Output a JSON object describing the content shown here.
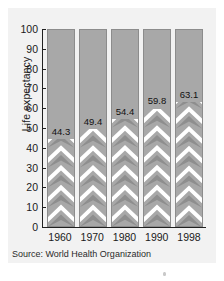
{
  "chart_data": {
    "type": "bar",
    "title": "",
    "xlabel": "",
    "ylabel": "Life expectancy",
    "categories": [
      "1960",
      "1970",
      "1980",
      "1990",
      "1998"
    ],
    "values": [
      44.3,
      49.4,
      54.4,
      59.8,
      63.1
    ],
    "value_labels": [
      "44.3",
      "49.4",
      "54.4",
      "59.8",
      "63.1"
    ],
    "ylim": [
      0,
      100
    ],
    "ytick_labels": [
      "0",
      "10",
      "20",
      "30",
      "40",
      "50",
      "60",
      "70",
      "80",
      "90",
      "100"
    ],
    "ytick_values": [
      0,
      10,
      20,
      30,
      40,
      50,
      60,
      70,
      80,
      90,
      100
    ],
    "grid": false,
    "legend": null,
    "annotations": [
      "Source: World Health Organization"
    ]
  },
  "source_note": "Source: World Health Organization",
  "colors": {
    "page_background": "#ffffff",
    "panel_background": "#f2f2f2",
    "bar_background": "#a8a8a8",
    "chevron_gray": "#8e8e8e",
    "chevron_white": "#ffffff",
    "axis": "#202020",
    "text": "#1a1a1a"
  }
}
